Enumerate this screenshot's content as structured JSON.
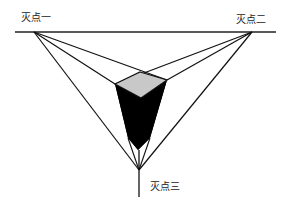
{
  "diagram": {
    "labels": {
      "vp1": "灭点一",
      "vp2": "灭点二",
      "vp3": "灭点三"
    },
    "colors": {
      "background": "#ffffff",
      "line": "#111111",
      "top_face": "#c8c8c8",
      "side_faces": "#000000"
    },
    "horizon": {
      "x1": 15,
      "y1": 32,
      "x2": 276,
      "y2": 32
    },
    "vanishing_points": {
      "vp1": {
        "x": 34,
        "y": 32
      },
      "vp2": {
        "x": 252,
        "y": 32
      },
      "vp3": {
        "x": 139,
        "y": 170
      }
    },
    "box": {
      "top_back": {
        "x": 140,
        "y": 72
      },
      "top_left": {
        "x": 115,
        "y": 84
      },
      "top_right": {
        "x": 167,
        "y": 80
      },
      "top_front": {
        "x": 141,
        "y": 98
      },
      "bottom_tip": {
        "x": 138,
        "y": 150
      }
    },
    "vertical_line": {
      "x1": 139,
      "y1": 150,
      "x2": 139,
      "y2": 197
    }
  }
}
